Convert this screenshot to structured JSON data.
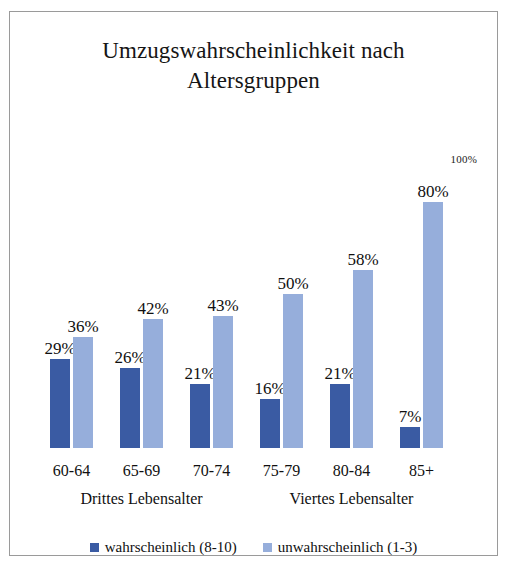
{
  "chart_data": {
    "type": "bar",
    "title": "Umzugswahrscheinlichkeit nach Altersgruppen",
    "title_line1": "Umzugswahrscheinlichkeit nach",
    "title_line2": "Altersgruppen",
    "xlabel": "",
    "ylabel": "",
    "ylim": [
      0,
      100
    ],
    "grid": false,
    "legend_position": "bottom",
    "axis_max_label": "100%",
    "categories": [
      "60-64",
      "65-69",
      "70-74",
      "75-79",
      "80-84",
      "85+"
    ],
    "group_bands": [
      {
        "label": "Drittes Lebensalter",
        "categories": [
          "60-64",
          "65-69",
          "70-74"
        ]
      },
      {
        "label": "Viertes Lebensalter",
        "categories": [
          "75-79",
          "80-84",
          "85+"
        ]
      }
    ],
    "series": [
      {
        "name": "wahrscheinlich (8-10)",
        "color": "#3a5ba3",
        "values": [
          29,
          26,
          21,
          16,
          21,
          7
        ],
        "labels": [
          "29%",
          "26%",
          "21%",
          "16%",
          "21%",
          "7%"
        ]
      },
      {
        "name": "unwahrscheinlich (1-3)",
        "color": "#96aedb",
        "values": [
          36,
          42,
          43,
          50,
          58,
          80
        ],
        "labels": [
          "36%",
          "42%",
          "43%",
          "50%",
          "58%",
          "80%"
        ]
      }
    ]
  },
  "legend": {
    "items": [
      {
        "label": "wahrscheinlich (8-10)",
        "color": "#3a5ba3"
      },
      {
        "label": "unwahrscheinlich (1-3)",
        "color": "#96aedb"
      }
    ]
  },
  "colors": {
    "series_dark": "#3a5ba3",
    "series_light": "#96aedb",
    "frame_border": "#9a9a9a",
    "text": "#101010",
    "background": "#ffffff"
  }
}
